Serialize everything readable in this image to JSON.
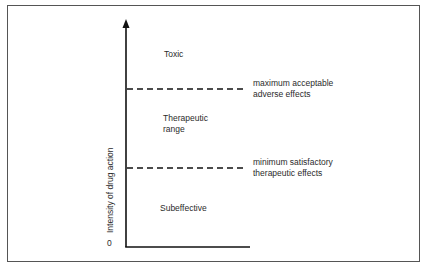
{
  "diagram": {
    "type": "therapeutic-window",
    "y_axis": {
      "label": "Intensity of drug action",
      "origin_label": "0"
    },
    "regions": [
      {
        "id": "toxic",
        "label": "Toxic"
      },
      {
        "id": "therapeutic",
        "label_line1": "Therapeutic",
        "label_line2": "range"
      },
      {
        "id": "subeffective",
        "label": "Subeffective"
      }
    ],
    "thresholds": [
      {
        "id": "upper",
        "line1": "maximum acceptable",
        "line2": "adverse effects"
      },
      {
        "id": "lower",
        "line1": "minimum satisfactory",
        "line2": "therapeutic effects"
      }
    ],
    "colors": {
      "line": "#111111",
      "text": "#2b2b2b",
      "frame": "#555555"
    }
  }
}
